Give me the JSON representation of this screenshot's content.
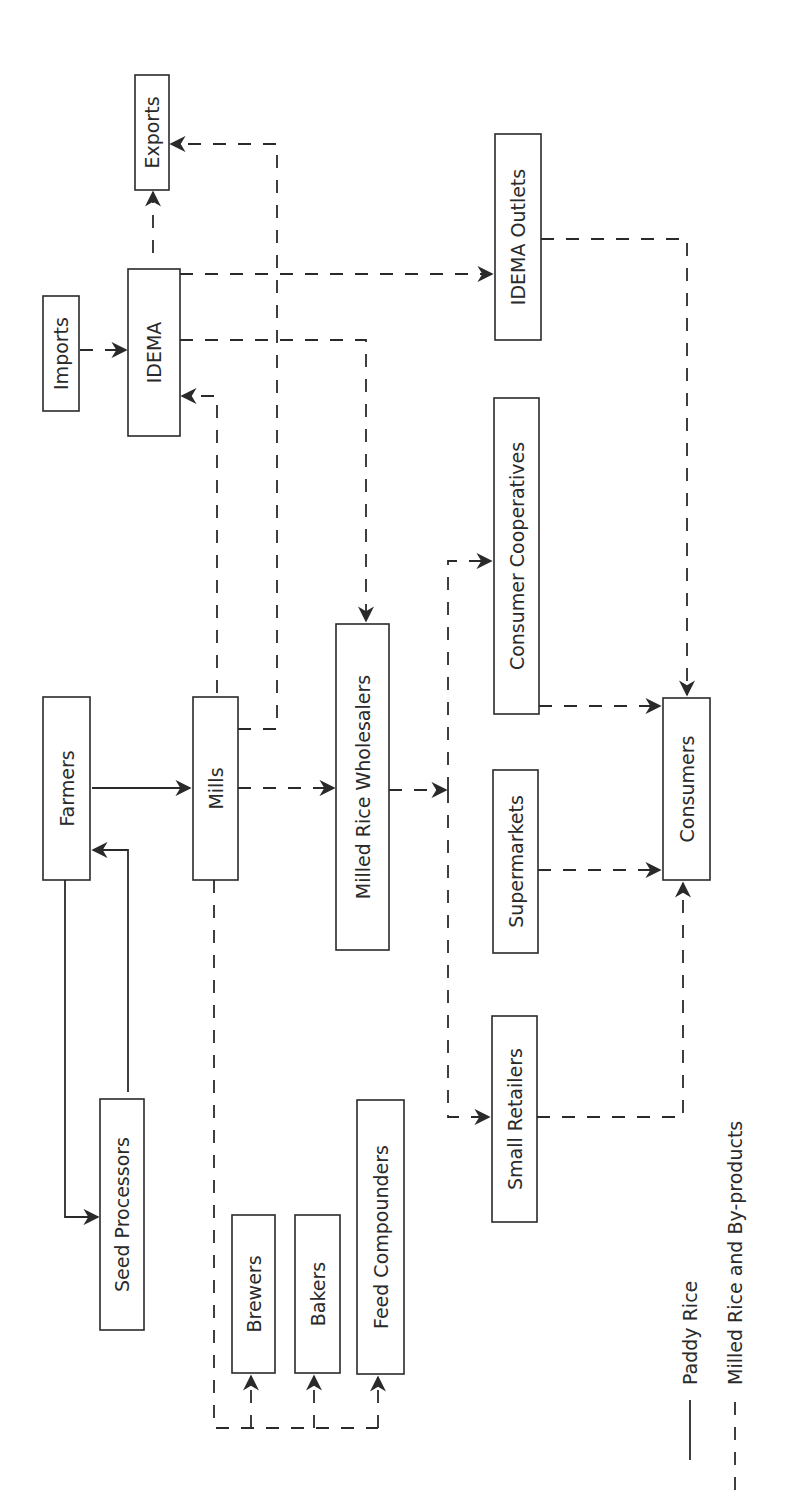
{
  "diagram": {
    "title": "",
    "orientation": "rotated-90-ccw",
    "colors": {
      "ink": "#2a2a2a",
      "background": "#ffffff"
    },
    "nodes": [
      {
        "id": "exports",
        "label": "Exports"
      },
      {
        "id": "imports",
        "label": "Imports"
      },
      {
        "id": "idema",
        "label": "IDEMA"
      },
      {
        "id": "idema-outlets",
        "label": "IDEMA Outlets"
      },
      {
        "id": "consumer-cooperatives",
        "label": "Consumer Cooperatives"
      },
      {
        "id": "milled-rice-wholesalers",
        "label": "Milled Rice Wholesalers"
      },
      {
        "id": "farmers",
        "label": "Farmers"
      },
      {
        "id": "mills",
        "label": "Mills"
      },
      {
        "id": "supermarkets",
        "label": "Supermarkets"
      },
      {
        "id": "consumers",
        "label": "Consumers"
      },
      {
        "id": "small-retailers",
        "label": "Small Retailers"
      },
      {
        "id": "seed-processors",
        "label": "Seed Processors"
      },
      {
        "id": "brewers",
        "label": "Brewers"
      },
      {
        "id": "bakers",
        "label": "Bakers"
      },
      {
        "id": "feed-compounders",
        "label": "Feed Compounders"
      }
    ],
    "edges": [
      {
        "from": "farmers",
        "to": "mills",
        "type": "paddy"
      },
      {
        "from": "farmers",
        "to": "seed-processors",
        "type": "paddy"
      },
      {
        "from": "seed-processors",
        "to": "farmers",
        "type": "paddy"
      },
      {
        "from": "imports",
        "to": "idema",
        "type": "milled"
      },
      {
        "from": "idema",
        "to": "exports",
        "type": "milled"
      },
      {
        "from": "mills",
        "to": "exports",
        "type": "milled"
      },
      {
        "from": "mills",
        "to": "idema",
        "type": "milled"
      },
      {
        "from": "mills",
        "to": "milled-rice-wholesalers",
        "type": "milled"
      },
      {
        "from": "idema",
        "to": "idema-outlets",
        "type": "milled"
      },
      {
        "from": "idema",
        "to": "milled-rice-wholesalers",
        "type": "milled"
      },
      {
        "from": "milled-rice-wholesalers",
        "to": "consumer-cooperatives",
        "type": "milled"
      },
      {
        "from": "milled-rice-wholesalers",
        "to": "supermarkets",
        "type": "milled"
      },
      {
        "from": "milled-rice-wholesalers",
        "to": "small-retailers",
        "type": "milled"
      },
      {
        "from": "idema-outlets",
        "to": "consumers",
        "type": "milled"
      },
      {
        "from": "consumer-cooperatives",
        "to": "consumers",
        "type": "milled"
      },
      {
        "from": "supermarkets",
        "to": "consumers",
        "type": "milled"
      },
      {
        "from": "small-retailers",
        "to": "consumers",
        "type": "milled"
      },
      {
        "from": "mills",
        "to": "brewers",
        "type": "milled"
      },
      {
        "from": "mills",
        "to": "bakers",
        "type": "milled"
      },
      {
        "from": "mills",
        "to": "feed-compounders",
        "type": "milled"
      }
    ],
    "legend": [
      {
        "id": "paddy",
        "label": "Paddy Rice",
        "line_style": "solid"
      },
      {
        "id": "milled",
        "label": "Milled Rice and By-products",
        "line_style": "dashed"
      }
    ]
  }
}
